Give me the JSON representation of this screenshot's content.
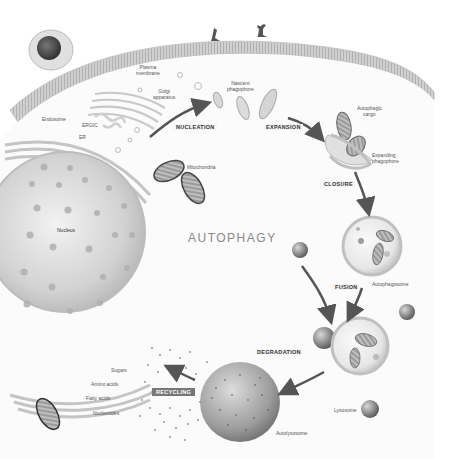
{
  "diagram": {
    "title": "AUTOPHAGY",
    "stages": {
      "nucleation": "NUCLEATION",
      "expansion": "EXPANSION",
      "closure": "CLOSURE",
      "fusion": "FUSION",
      "degradation": "DEGRADATION",
      "recycling": "RECYCLING"
    },
    "labels": {
      "plasma_membrane": [
        "Plasma",
        "membrane"
      ],
      "golgi": [
        "Golgi",
        "apparatus"
      ],
      "nascent_phagophore": [
        "Nascent",
        "phagophore"
      ],
      "endosome": "Endosome",
      "ergic": "ERGIC",
      "er": "ER",
      "mitochondria": "Mitochondria",
      "nucleus": "Nucleus",
      "autophagic_cargo": [
        "Autophagic",
        "cargo"
      ],
      "expanding_phagophore": [
        "Expanding",
        "phagophore"
      ],
      "autophagosome": "Autophagosome",
      "autolysosome": "Autolysosome",
      "lysosome": "Lysosome"
    },
    "products": [
      "Sugars",
      "Amino acids",
      "Fatty acids",
      "Nucleotides"
    ],
    "colors": {
      "background": "#ffffff",
      "membrane": "#c8c8c8",
      "nucleus": "#d6d6d6",
      "organelle_dark": "#666666",
      "arrow": "#555555",
      "label_text": "#555555",
      "title_text": "#888888"
    }
  }
}
